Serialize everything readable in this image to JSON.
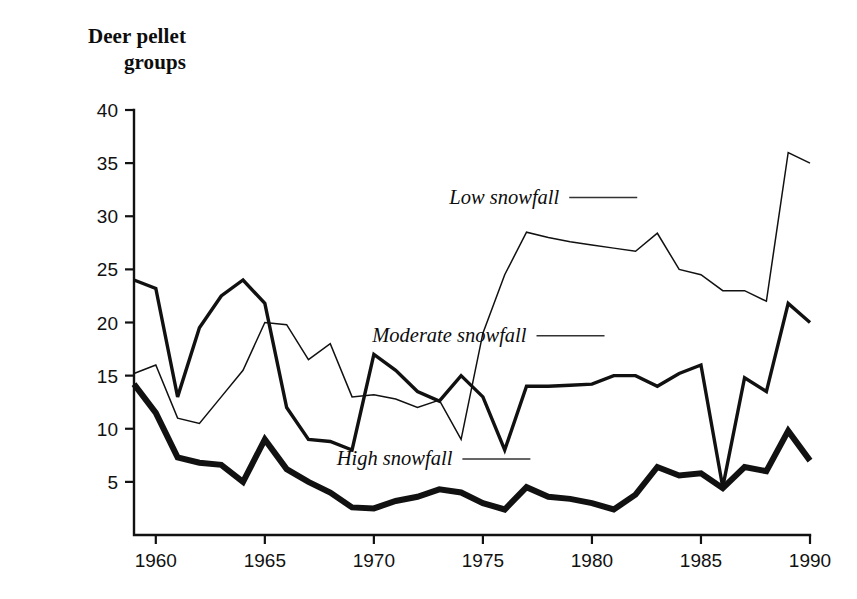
{
  "chart_data": {
    "type": "line",
    "title": "Deer pellet\ngroups",
    "ylabel": "Deer pellet groups",
    "xlabel": "",
    "xlim": [
      1959,
      1990
    ],
    "ylim": [
      0,
      40
    ],
    "grid": false,
    "legend_position": "inline-labels",
    "xticks": [
      1960,
      1965,
      1970,
      1975,
      1980,
      1985,
      1990
    ],
    "xtick_labels": [
      "1960",
      "1965",
      "1970",
      "1975",
      "1980",
      "1985",
      "1990"
    ],
    "yticks": [
      5,
      10,
      15,
      20,
      25,
      30,
      35,
      40
    ],
    "ytick_labels": [
      "5",
      "10",
      "15",
      "20",
      "25",
      "30",
      "35",
      "40"
    ],
    "x": [
      1959,
      1960,
      1961,
      1962,
      1963,
      1964,
      1965,
      1966,
      1967,
      1968,
      1969,
      1970,
      1971,
      1972,
      1973,
      1974,
      1975,
      1976,
      1977,
      1978,
      1979,
      1980,
      1981,
      1982,
      1983,
      1984,
      1985,
      1986,
      1987,
      1988,
      1989,
      1990
    ],
    "series": [
      {
        "name": "Low snowfall",
        "line_weight": "thin",
        "values": [
          15.2,
          16.0,
          11.0,
          10.5,
          13.0,
          15.5,
          20.0,
          19.8,
          16.5,
          18.0,
          13.0,
          13.2,
          12.8,
          12.0,
          12.7,
          9.0,
          19.0,
          24.5,
          28.5,
          28.0,
          27.6,
          27.3,
          27.0,
          26.7,
          28.4,
          25.0,
          24.5,
          23.0,
          23.0,
          22.0,
          36.0,
          35.0
        ]
      },
      {
        "name": "Moderate snowfall",
        "line_weight": "medium",
        "values": [
          24.0,
          23.2,
          13.0,
          19.5,
          22.5,
          24.0,
          21.8,
          12.0,
          9.0,
          8.8,
          8.0,
          17.0,
          15.5,
          13.5,
          12.6,
          15.0,
          13.0,
          8.0,
          14.0,
          14.0,
          14.1,
          14.2,
          15.0,
          15.0,
          14.0,
          15.2,
          16.0,
          4.5,
          14.8,
          13.5,
          21.8,
          20.0
        ]
      },
      {
        "name": "High snowfall",
        "line_weight": "thick",
        "values": [
          14.2,
          11.5,
          7.3,
          6.8,
          6.6,
          5.0,
          9.0,
          6.2,
          5.0,
          4.0,
          2.6,
          2.5,
          3.2,
          3.6,
          4.3,
          4.0,
          3.0,
          2.4,
          4.5,
          3.6,
          3.4,
          3.0,
          2.4,
          3.8,
          6.4,
          5.6,
          5.8,
          4.4,
          6.4,
          6.0,
          9.8,
          7.0
        ]
      }
    ],
    "annotations": [
      {
        "text": "Low snowfall",
        "x": 1978.5,
        "y": 31.2
      },
      {
        "text": "Moderate snowfall",
        "x": 1977.0,
        "y": 18.2
      },
      {
        "text": "High snowfall",
        "x": 1973.6,
        "y": 6.6
      }
    ],
    "colors": {
      "line": "#111111",
      "axis": "#111111",
      "text": "#111111",
      "background": "#ffffff"
    }
  }
}
